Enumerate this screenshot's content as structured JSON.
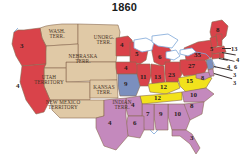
{
  "map": {
    "title": "1860",
    "type": "electoral-map",
    "colors": {
      "republican_red": "#d9434a",
      "constitutional_union_yellow": "#f2e21c",
      "southern_democrat_purple": "#c489bd",
      "northern_democrat_blue": "#7b8fbe",
      "territory_tan": "#e0c9a6",
      "border": "#8a6a50",
      "lake": "#ffffff",
      "lake_outline": "#7ea7d8",
      "text": "#3a2a1e"
    },
    "territories": [
      {
        "name": "washington-territory",
        "label": "WASH.\nTERR.",
        "line1": "WASH.",
        "line2": "TERR.",
        "x": 56,
        "y": 16
      },
      {
        "name": "unorganized-territory",
        "label": "UNORG.\nTERR.",
        "line1": "UNORG.",
        "line2": "TERR.",
        "x": 104,
        "y": 22
      },
      {
        "name": "nebraska-territory",
        "label": "NEBRASKA\nTERR.",
        "line1": "NEBRASKA",
        "line2": "TERR.",
        "x": 82,
        "y": 41
      },
      {
        "name": "utah-territory",
        "label": "UTAH\nTERRITORY",
        "line1": "UTAH",
        "line2": "TERRITORY",
        "x": 48,
        "y": 62
      },
      {
        "name": "kansas-territory",
        "label": "KANSAS\nTERR.",
        "line1": "KANSAS",
        "line2": "TERR.",
        "x": 104,
        "y": 72
      },
      {
        "name": "new-mexico-territory",
        "label": "NEW MEXICO\nTERRITORY",
        "line1": "NEW MEXICO",
        "line2": "TERRITORY",
        "x": 62,
        "y": 87
      },
      {
        "name": "indian-territory",
        "label": "INDIAN\nTERR.",
        "line1": "INDIAN",
        "line2": "TERR.",
        "x": 122,
        "y": 87
      }
    ],
    "states": [
      {
        "name": "oregon",
        "votes": "3",
        "party": "republican",
        "x": 20,
        "y": 31
      },
      {
        "name": "california",
        "votes": "4",
        "party": "republican",
        "x": 16,
        "y": 71
      },
      {
        "name": "minnesota",
        "votes": "4",
        "party": "republican",
        "x": 120,
        "y": 28
      },
      {
        "name": "wisconsin",
        "votes": "5",
        "party": "republican",
        "x": 135,
        "y": 37
      },
      {
        "name": "michigan",
        "votes": "6",
        "party": "republican",
        "x": 158,
        "y": 41
      },
      {
        "name": "iowa",
        "votes": "4",
        "party": "republican",
        "x": 126,
        "y": 52
      },
      {
        "name": "illinois",
        "votes": "11",
        "party": "republican",
        "x": 142,
        "y": 63
      },
      {
        "name": "indiana",
        "votes": "13",
        "party": "republican",
        "x": 158,
        "y": 63
      },
      {
        "name": "ohio",
        "votes": "23",
        "party": "republican",
        "x": 172,
        "y": 61
      },
      {
        "name": "pennsylvania",
        "votes": "27",
        "party": "republican",
        "x": 192,
        "y": 51
      },
      {
        "name": "new-york",
        "votes": "35",
        "party": "republican",
        "x": 199,
        "y": 40
      },
      {
        "name": "maine",
        "votes": "8",
        "party": "republican",
        "x": 218,
        "y": 22
      },
      {
        "name": "missouri",
        "votes": "9",
        "party": "northern-democrat",
        "x": 129,
        "y": 73
      },
      {
        "name": "kentucky",
        "votes": "12",
        "party": "constitutional-union",
        "x": 167,
        "y": 75
      },
      {
        "name": "tennessee",
        "votes": "12",
        "party": "constitutional-union",
        "x": 163,
        "y": 86
      },
      {
        "name": "virginia",
        "votes": "15",
        "party": "constitutional-union",
        "x": 188,
        "y": 73
      },
      {
        "name": "north-carolina",
        "votes": "10",
        "party": "southern-democrat",
        "x": 194,
        "y": 85
      },
      {
        "name": "south-carolina",
        "votes": "8",
        "party": "southern-democrat",
        "x": 190,
        "y": 98
      },
      {
        "name": "georgia",
        "votes": "10",
        "party": "southern-democrat",
        "x": 176,
        "y": 101
      },
      {
        "name": "alabama",
        "votes": "9",
        "party": "southern-democrat",
        "x": 161,
        "y": 101
      },
      {
        "name": "mississippi",
        "votes": "7",
        "party": "southern-democrat",
        "x": 147,
        "y": 101
      },
      {
        "name": "arkansas",
        "votes": "4",
        "party": "southern-democrat",
        "x": 135,
        "y": 89
      },
      {
        "name": "louisiana",
        "votes": "6",
        "party": "southern-democrat",
        "x": 138,
        "y": 112
      },
      {
        "name": "texas",
        "votes": "4",
        "party": "southern-democrat",
        "x": 106,
        "y": 120
      },
      {
        "name": "florida",
        "votes": "3",
        "party": "southern-democrat",
        "x": 193,
        "y": 124
      }
    ],
    "callouts": [
      {
        "name": "vermont",
        "votes": "5",
        "x": 213,
        "y": 35
      },
      {
        "name": "new-hampshire",
        "votes": "13",
        "x": 231,
        "y": 34
      },
      {
        "name": "massachusetts",
        "votes": "4",
        "x": 233,
        "y": 44
      },
      {
        "name": "rhode-island",
        "votes": "6",
        "x": 232,
        "y": 51
      },
      {
        "name": "connecticut",
        "votes": "4",
        "x": 225,
        "y": 50
      },
      {
        "name": "new-jersey",
        "votes": "3",
        "x": 231,
        "y": 58
      },
      {
        "name": "delaware",
        "votes": "3",
        "x": 231,
        "y": 66
      },
      {
        "name": "maryland",
        "votes": "8",
        "x": 203,
        "y": 63
      }
    ]
  }
}
